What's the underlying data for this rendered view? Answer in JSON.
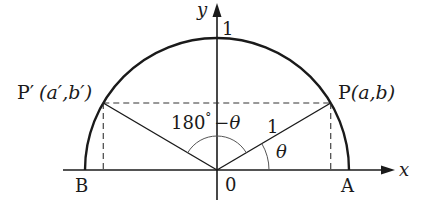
{
  "diagram": {
    "labels": {
      "y_axis": "y",
      "x_axis": "x",
      "one_top": "1",
      "radius_one": "1",
      "origin": "0",
      "point_A": "A",
      "point_B": "B",
      "point_P_name": "P",
      "point_P_coords": "(a,b)",
      "point_Pprime_name": "P′",
      "point_Pprime_coords": "(a′,b′)",
      "angle_theta": "θ",
      "angle_supplement_num": "180",
      "angle_supplement_deg": "°",
      "angle_supplement_rest": "−θ"
    },
    "angle_theta_degrees": 30.5,
    "radius": 1,
    "colors": {
      "stroke": "#1a1a1a",
      "background": "#ffffff"
    }
  }
}
